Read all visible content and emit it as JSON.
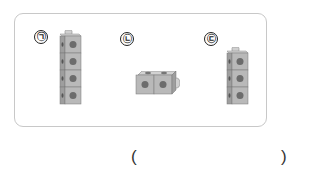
{
  "options": [
    {
      "label": "㉠",
      "cubes": 4,
      "orientation": "vertical"
    },
    {
      "label": "㉡",
      "cubes": 2,
      "orientation": "horizontal"
    },
    {
      "label": "㉢",
      "cubes": 3,
      "orientation": "vertical"
    }
  ],
  "answer": {
    "open": "(",
    "close": ")",
    "value": ""
  },
  "colors": {
    "cube_face": "#b9b9b9",
    "cube_side": "#9e9e9e",
    "cube_top": "#d2d2d2",
    "dot": "#6c6c6c",
    "border": "#c8c8c8"
  }
}
